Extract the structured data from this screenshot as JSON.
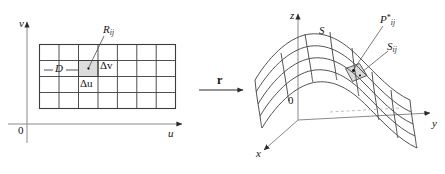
{
  "figure": {
    "background_color": "#ffffff",
    "line_color": "#3c3c3c",
    "shade_color": "#d9d9d9",
    "text_color": "#141414"
  },
  "left_panel": {
    "name": "uv-plane domain",
    "axes": {
      "vertical_label": "v",
      "horizontal_label": "u",
      "origin_label": "0"
    },
    "domain_label": "D",
    "cell_label": "R",
    "cell_label_sub": "ij",
    "delta_u_label": "Δu",
    "delta_v_label": "Δv",
    "grid": {
      "columns": 7,
      "rows": 4,
      "highlight_column": 3,
      "highlight_row": 2
    }
  },
  "map_arrow": {
    "label": "r",
    "direction": "right"
  },
  "right_panel": {
    "name": "xyz-space surface",
    "axes": {
      "vertical_label": "z",
      "right_label": "y",
      "front_label": "x",
      "origin_label": "0"
    },
    "surface_label": "S",
    "patch_label": "S",
    "patch_label_sub": "ij",
    "point_label": "P",
    "point_label_sub": "ij",
    "point_label_star": "*"
  }
}
